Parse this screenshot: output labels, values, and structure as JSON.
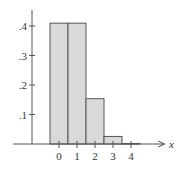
{
  "chart_data": {
    "type": "bar",
    "title": "",
    "xlabel": "x",
    "ylabel": "",
    "categories": [
      "0",
      "1",
      "2",
      "3",
      "4"
    ],
    "values": [
      0.4096,
      0.4096,
      0.1536,
      0.0256,
      0.0016
    ],
    "ylim": [
      0,
      0.45
    ],
    "yticks": [
      0.1,
      0.2,
      0.3,
      0.4
    ],
    "ytick_labels": [
      ".1",
      ".2",
      ".3",
      ".4"
    ],
    "xticks": [
      0,
      1,
      2,
      3,
      4
    ],
    "xtick_labels": [
      "0",
      "1",
      "2",
      "3",
      "4"
    ],
    "grid": false,
    "legend": null,
    "bar_fill": "#d9d9d9",
    "bar_stroke": "#555555",
    "axis_color": "#555555"
  }
}
